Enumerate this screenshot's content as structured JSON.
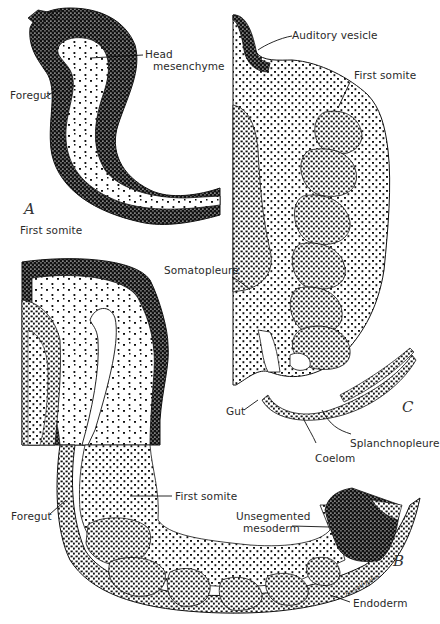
{
  "figure": {
    "panels": [
      {
        "id": "A",
        "label": "A"
      },
      {
        "id": "B",
        "label": "B"
      },
      {
        "id": "C",
        "label": "C"
      }
    ],
    "labels": {
      "head_mesenchyme_line1": "Head",
      "head_mesenchyme_line2": "mesenchyme",
      "foregut_a": "Foregut",
      "first_somite_a": "First somite",
      "auditory_vesicle": "Auditory vesicle",
      "first_somite_c": "First somite",
      "somatopleure": "Somatopleure",
      "gut": "Gut",
      "splanchnopleure": "Splanchnopleure",
      "coelom": "Coelom",
      "first_somite_b": "First somite",
      "foregut_b": "Foregut",
      "unsegmented_mesoderm_line1": "Unsegmented",
      "unsegmented_mesoderm_line2": "mesoderm",
      "endoderm": "Endoderm"
    },
    "signature": "Bassett Bakes",
    "colors": {
      "ink": "#111111",
      "label": "#2a2a2a",
      "background": "#ffffff"
    }
  }
}
